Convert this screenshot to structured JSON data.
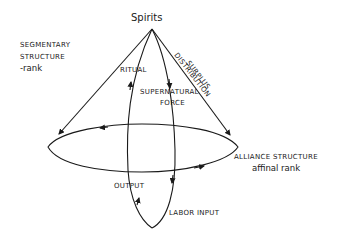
{
  "diagram": {
    "apex_label": "Spirits",
    "left_label": {
      "line1": "SEGMENTARY",
      "line2": "STRUCTURE",
      "line3": "-rank"
    },
    "right_top_label": {
      "line1": "SURPLUS",
      "line2": "DISTRIBUTION"
    },
    "ritual_label": "RITUAL",
    "supernatural_label": {
      "line1": "SUPERNATURAL",
      "line2": "FORCE"
    },
    "alliance_label": {
      "line1": "ALLIANCE STRUCTURE",
      "line2": "affinal rank"
    },
    "output_label": "OUTPUT",
    "labor_label": "LABOR INPUT",
    "colors": {
      "ink": "#1a1a1a",
      "background": "#ffffff"
    }
  }
}
